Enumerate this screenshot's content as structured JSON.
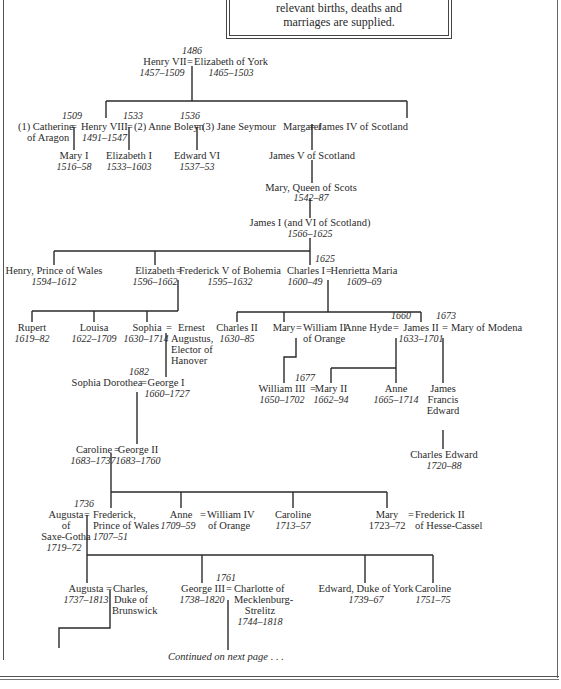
{
  "intro_box": {
    "line1": "relevant births, deaths and",
    "line2": "marriages are supplied."
  },
  "people": {
    "henry7": {
      "name": "Henry VII",
      "dates": "1457–1509"
    },
    "eliz_york": {
      "name": "Elizabeth of York",
      "dates": "1465–1503"
    },
    "m_henry7": "1486",
    "catherine": {
      "name": "(1) Catherine",
      "name2": "of Aragon"
    },
    "m_catherine": "1509",
    "henry8": {
      "name": "Henry VIII",
      "dates": "1491–1547"
    },
    "m_boleyn": "1533",
    "anne_boleyn": {
      "name": "(2) Anne Boleyn"
    },
    "m_seymour": "1536",
    "jane_seymour": {
      "name": "(3) Jane Seymour"
    },
    "margaret": {
      "name": "Margaret"
    },
    "james4": {
      "name": "James IV of Scotland"
    },
    "mary1": {
      "name": "Mary I",
      "dates": "1516–58"
    },
    "elizabeth1": {
      "name": "Elizabeth I",
      "dates": "1533–1603"
    },
    "edward6": {
      "name": "Edward VI",
      "dates": "1537–53"
    },
    "james5": {
      "name": "James V of Scotland"
    },
    "mary_scots": {
      "name": "Mary, Queen of Scots",
      "dates": "1542–87"
    },
    "james1": {
      "name": "James I (and VI of Scotland)",
      "dates": "1566–1625"
    },
    "henry_wales": {
      "name": "Henry, Prince of Wales",
      "dates": "1594–1612"
    },
    "elizabeth_boh": {
      "name": "Elizabeth",
      "dates": "1596–1662"
    },
    "frederick5": {
      "name": "Frederick V of Bohemia",
      "dates": "1595–1632"
    },
    "m_charles1": "1625",
    "charles1": {
      "name": "Charles I",
      "dates": "1600–49"
    },
    "henrietta": {
      "name": "Henrietta Maria",
      "dates": "1609–69"
    },
    "rupert": {
      "name": "Rupert",
      "dates": "1619–82"
    },
    "louisa": {
      "name": "Louisa",
      "dates": "1622–1709"
    },
    "sophia": {
      "name": "Sophia",
      "dates": "1630–1714"
    },
    "ernest": {
      "name": "Ernest",
      "name2": "Augustus,",
      "name3": "Elector of",
      "name4": "Hanover"
    },
    "charles2": {
      "name": "Charles II",
      "dates": "1630–85"
    },
    "mary_orange": {
      "name": "Mary"
    },
    "william2": {
      "name": "William II",
      "name2": "of Orange"
    },
    "m_hyde": "1660",
    "anne_hyde": {
      "name": "Anne Hyde"
    },
    "james2": {
      "name": "James II",
      "dates": "1633–1701"
    },
    "m_modena": "1673",
    "mary_modena": {
      "name": "Mary of Modena"
    },
    "m_george1": "1682",
    "sophia_dorothea": {
      "name": "Sophia Dorothea"
    },
    "george1": {
      "name": "George I",
      "dates": "1660–1727"
    },
    "m_william3": "1677",
    "william3": {
      "name": "William III",
      "dates": "1650–1702"
    },
    "mary2": {
      "name": "Mary II",
      "dates": "1662–94"
    },
    "anne": {
      "name": "Anne",
      "dates": "1665–1714"
    },
    "james_francis": {
      "name": "James",
      "name2": "Francis",
      "name3": "Edward"
    },
    "charles_edward": {
      "name": "Charles Edward",
      "dates": "1720–88"
    },
    "caroline_a": {
      "name": "Caroline",
      "dates": "1683–1737"
    },
    "george2": {
      "name": "George II",
      "dates": "1683–1760"
    },
    "m_frederick": "1736",
    "augusta_sg": {
      "name": "Augusta",
      "name2": "of",
      "name3": "Saxe-Gotha",
      "dates": "1719–72"
    },
    "frederick_pw": {
      "name": "Frederick,",
      "name2": "Prince of Wales",
      "dates": "1707–51"
    },
    "anne_orange": {
      "name": "Anne",
      "dates": "1709–59"
    },
    "william4": {
      "name": "William IV",
      "name2": "of Orange"
    },
    "caroline_b": {
      "name": "Caroline",
      "dates": "1713–57"
    },
    "mary_hesse": {
      "name": "Mary",
      "dates": "1723–72"
    },
    "frederick2": {
      "name": "Frederick II",
      "name2": "of Hesse-Cassel"
    },
    "augusta_b": {
      "name": "Augusta",
      "dates": "1737–1813"
    },
    "charles_brunswick": {
      "name": "Charles,",
      "name2": "Duke of",
      "name3": "Brunswick"
    },
    "m_george3": "1761",
    "george3": {
      "name": "George III",
      "dates": "1738–1820"
    },
    "charlotte": {
      "name": "Charlotte of",
      "name2": "Mecklenburg-",
      "name3": "Strelitz",
      "dates": "1744–1818"
    },
    "edward_york": {
      "name": "Edward, Duke of York",
      "dates": "1739–67"
    },
    "caroline_c": {
      "name": "Caroline",
      "dates": "1751–75"
    }
  },
  "marriage_symbol": "=",
  "footer": {
    "continued": "Continued on next page . . ."
  }
}
